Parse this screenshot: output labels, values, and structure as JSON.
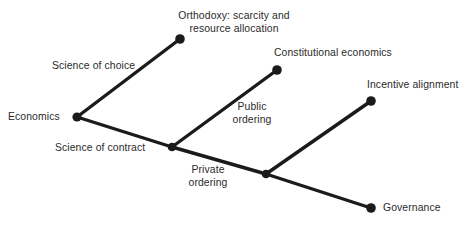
{
  "diagram": {
    "type": "tree",
    "background_color": "#ffffff",
    "line_color": "#1b1b1b",
    "node_color": "#1b1b1b",
    "text_color": "#2b2b2b",
    "nodes": [
      {
        "id": "economics",
        "label": "Economics",
        "x": 77,
        "y": 117
      },
      {
        "id": "orthodoxy",
        "label": "Orthodoxy: scarcity and resource allocation",
        "x": 180,
        "y": 39
      },
      {
        "id": "junction_a",
        "label": "",
        "x": 172,
        "y": 147
      },
      {
        "id": "constitutional",
        "label": "Constitutional economics",
        "x": 277,
        "y": 70
      },
      {
        "id": "junction_b",
        "label": "",
        "x": 266,
        "y": 174
      },
      {
        "id": "incentive",
        "label": "Incentive alignment",
        "x": 371,
        "y": 101
      },
      {
        "id": "governance",
        "label": "Governance",
        "x": 371,
        "y": 208
      }
    ],
    "edges": [
      {
        "id": "edge-science-of-choice",
        "from": "economics",
        "to": "orthodoxy",
        "label": "Science of choice"
      },
      {
        "id": "edge-science-of-contract",
        "from": "economics",
        "to": "junction_a",
        "label": "Science of contract"
      },
      {
        "id": "edge-public-ordering",
        "from": "junction_a",
        "to": "constitutional",
        "label_line1": "Public",
        "label_line2": "ordering"
      },
      {
        "id": "edge-private-ordering",
        "from": "junction_a",
        "to": "junction_b",
        "label_line1": "Private",
        "label_line2": "ordering"
      },
      {
        "id": "edge-incentive",
        "from": "junction_b",
        "to": "incentive",
        "label": ""
      },
      {
        "id": "edge-governance",
        "from": "junction_b",
        "to": "governance",
        "label": ""
      }
    ],
    "labels": {
      "orthodoxy_line1": "Orthodoxy: scarcity and",
      "orthodoxy_line2": "resource allocation",
      "science_of_choice": "Science of choice",
      "constitutional_economics": "Constitutional economics",
      "incentive_alignment": "Incentive alignment",
      "economics": "Economics",
      "science_of_contract": "Science of contract",
      "public_ordering_line1": "Public",
      "public_ordering_line2": "ordering",
      "private_ordering_line1": "Private",
      "private_ordering_line2": "ordering",
      "governance": "Governance"
    }
  }
}
